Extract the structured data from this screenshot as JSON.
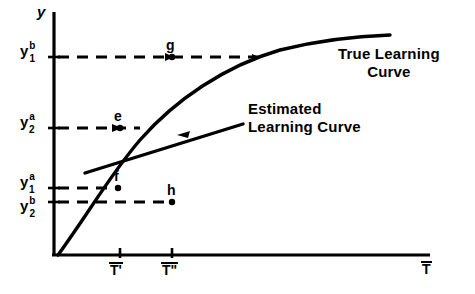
{
  "figure": {
    "background_color": "#ffffff",
    "ink_color": "#000000"
  },
  "axes": {
    "y_axis_label": "y",
    "x_axis_label": "T",
    "x_axis_label_overbar": true,
    "origin": {
      "x": 54,
      "y": 255
    },
    "x_axis_end": {
      "x": 430,
      "y": 255
    },
    "y_axis_top": {
      "x": 54,
      "y": 12
    }
  },
  "y_ticks": [
    {
      "base": "y",
      "sub": "1",
      "sup": "b",
      "pixel_y": 57,
      "label_x": 20
    },
    {
      "base": "y",
      "sub": "2",
      "sup": "a",
      "pixel_y": 128,
      "label_x": 20
    },
    {
      "base": "y",
      "sub": "1",
      "sup": "a",
      "pixel_y": 188,
      "label_x": 20
    },
    {
      "base": "y",
      "sub": "2",
      "sup": "b",
      "pixel_y": 202,
      "label_x": 20
    }
  ],
  "x_ticks": [
    {
      "label": "T'",
      "overbar": true,
      "pixel_x": 120
    },
    {
      "label": "T\"",
      "overbar": true,
      "pixel_x": 172
    }
  ],
  "points": [
    {
      "name": "g",
      "x": 172,
      "y": 57,
      "label_dx": -4,
      "label_dy": -18
    },
    {
      "name": "e",
      "x": 120,
      "y": 128,
      "label_dx": -4,
      "label_dy": -18
    },
    {
      "name": "f",
      "x": 118,
      "y": 188,
      "label_dx": -4,
      "label_dy": -18
    },
    {
      "name": "h",
      "x": 172,
      "y": 202,
      "label_dx": -4,
      "label_dy": -18
    }
  ],
  "dashed_lines": [
    {
      "from_tick": "y1b",
      "y": 57,
      "x_start": 54,
      "x_end": 262,
      "arrow_at_x": 172,
      "terminal_arrow": true
    },
    {
      "from_tick": "y2a",
      "y": 128,
      "x_start": 54,
      "x_end": 137,
      "arrow_at_x": 120,
      "terminal_arrow": false
    },
    {
      "from_tick": "y1a",
      "y": 188,
      "x_start": 54,
      "x_end": 118,
      "arrow_at_x": 104,
      "terminal_arrow": false
    },
    {
      "from_tick": "y2b",
      "y": 202,
      "x_start": 54,
      "x_end": 172,
      "arrow_at_x": 160,
      "terminal_arrow": false
    }
  ],
  "curves": [
    {
      "id": "true-learning-curve",
      "label_lines": [
        "True Learning",
        "Curve"
      ],
      "label_x": 338,
      "label_y": 52,
      "description": "concave increasing curve from origin leveling off at right"
    },
    {
      "id": "estimated-learning-curve",
      "label_lines": [
        "Estimated",
        "Learning Curve"
      ],
      "label_x": 248,
      "label_y": 103,
      "description": "straight line of shallower slope crossing the true curve"
    }
  ],
  "annotations": {
    "estimated_line_arrow_x": 206,
    "estimated_line_arrow_y": 133
  }
}
